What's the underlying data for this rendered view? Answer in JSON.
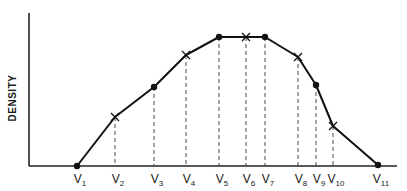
{
  "chart_data": {
    "type": "line",
    "title": "",
    "xlabel": "",
    "ylabel": "DENSITY",
    "grid": false,
    "legend": null,
    "categories": [
      "V1",
      "V2",
      "V3",
      "V4",
      "V5",
      "V6",
      "V7",
      "V8",
      "V9",
      "V10",
      "V11"
    ],
    "tick_labels": [
      {
        "base": "V",
        "sub": "1"
      },
      {
        "base": "V",
        "sub": "2"
      },
      {
        "base": "V",
        "sub": "3"
      },
      {
        "base": "V",
        "sub": "4"
      },
      {
        "base": "V",
        "sub": "5"
      },
      {
        "base": "V",
        "sub": "6"
      },
      {
        "base": "V",
        "sub": "7"
      },
      {
        "base": "V",
        "sub": "8"
      },
      {
        "base": "V",
        "sub": "9"
      },
      {
        "base": "V",
        "sub": "10"
      },
      {
        "base": "V",
        "sub": "11"
      }
    ],
    "series": [
      {
        "name": "density",
        "points": [
          {
            "label": "V1",
            "x": 77,
            "y": 166,
            "marker": "dot"
          },
          {
            "label": "V2",
            "x": 115,
            "y": 117,
            "marker": "cross"
          },
          {
            "label": "V3",
            "x": 154,
            "y": 87,
            "marker": "dot"
          },
          {
            "label": "V4",
            "x": 186,
            "y": 55,
            "marker": "cross"
          },
          {
            "label": "V5",
            "x": 219,
            "y": 37,
            "marker": "dot"
          },
          {
            "label": "V6",
            "x": 246,
            "y": 37,
            "marker": "cross"
          },
          {
            "label": "V7",
            "x": 265,
            "y": 37,
            "marker": "dot"
          },
          {
            "label": "V8",
            "x": 298,
            "y": 57,
            "marker": "cross"
          },
          {
            "label": "V9",
            "x": 316,
            "y": 85,
            "marker": "dot"
          },
          {
            "label": "V10",
            "x": 333,
            "y": 126,
            "marker": "cross"
          },
          {
            "label": "V11",
            "x": 378,
            "y": 165,
            "marker": "dot"
          }
        ]
      }
    ],
    "relative_density_0_to_1": [
      0.0,
      0.38,
      0.61,
      0.86,
      1.0,
      1.0,
      1.0,
      0.84,
      0.63,
      0.31,
      0.0
    ],
    "axes": {
      "origin_x": 29,
      "baseline_y": 166,
      "y_top": 13,
      "x_right": 397
    },
    "colors": {
      "line": "#111111",
      "axis": "#222222",
      "dashed": "#333333",
      "background": "#ffffff"
    }
  }
}
